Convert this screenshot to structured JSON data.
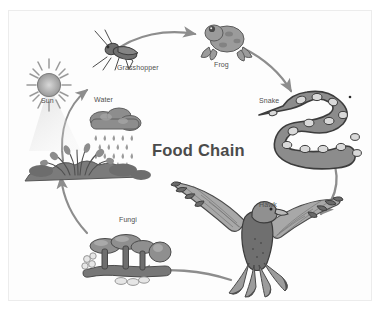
{
  "diagram": {
    "title": "Food Chain",
    "type": "cycle-diagram",
    "background_color": "#ffffff",
    "frame_color": "#ececec",
    "label_color": "#4f4f4f",
    "title_color": "#4b4b4b",
    "arrow_color": "#8f8f8f"
  },
  "nodes": [
    {
      "id": "sun",
      "label": "Sun",
      "icon": "sun-icon"
    },
    {
      "id": "water",
      "label": "Water",
      "icon": "rain-cloud-icon"
    },
    {
      "id": "grasshopper",
      "label": "Grasshopper",
      "icon": "grasshopper-icon"
    },
    {
      "id": "frog",
      "label": "Frog",
      "icon": "frog-icon"
    },
    {
      "id": "snake",
      "label": "Snake",
      "icon": "snake-icon"
    },
    {
      "id": "hawk",
      "label": "Hawk",
      "icon": "hawk-icon"
    },
    {
      "id": "fungi",
      "label": "Fungi",
      "icon": "mushroom-icon"
    }
  ],
  "plants": {
    "icon": "plants-icon"
  },
  "arrows": [
    {
      "id": "plants-to-grasshopper",
      "from": "plants",
      "to": "grasshopper"
    },
    {
      "id": "grasshopper-to-frog",
      "from": "grasshopper",
      "to": "frog"
    },
    {
      "id": "frog-to-snake",
      "from": "frog",
      "to": "snake"
    },
    {
      "id": "snake-to-hawk",
      "from": "snake",
      "to": "hawk"
    },
    {
      "id": "hawk-to-fungi",
      "from": "hawk",
      "to": "fungi"
    },
    {
      "id": "fungi-to-plants",
      "from": "fungi",
      "to": "plants"
    }
  ]
}
